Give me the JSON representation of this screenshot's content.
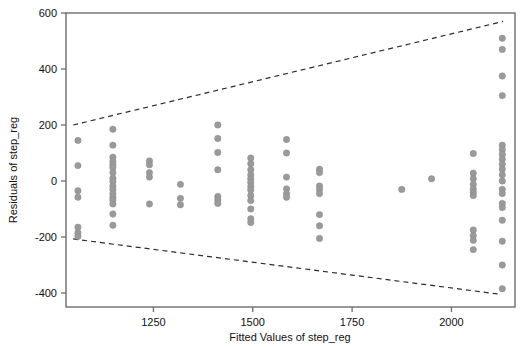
{
  "chart_data": {
    "type": "scatter",
    "title": "",
    "subtitle": "",
    "xlabel": "Fitted Values of step_reg",
    "ylabel": "Residuals of step_reg",
    "xlim": [
      1030,
      2160
    ],
    "ylim": [
      -450,
      600
    ],
    "xticks": [
      1250,
      1500,
      1750,
      2000
    ],
    "xtick_labels": [
      "1250",
      "1500",
      "1750",
      "2000"
    ],
    "yticks": [
      -400,
      -200,
      0,
      200,
      400,
      600
    ],
    "ytick_labels": [
      "-400",
      "-200",
      "0",
      "200",
      "400",
      "600"
    ],
    "grid": false,
    "legend": null,
    "legend_position": "none",
    "marker_color": "#9a9a9a",
    "marker_size": 3.2,
    "axis_color": "#6d6d6d",
    "text_color": "#111111",
    "annotations": [
      {
        "name": "upper-funnel-band",
        "type": "dashed-line",
        "x": [
          1048,
          2130
        ],
        "y": [
          200,
          570
        ],
        "color": "#2b2b2b",
        "dash": "5,4"
      },
      {
        "name": "lower-funnel-band",
        "type": "dashed-line",
        "x": [
          1048,
          2125
        ],
        "y": [
          -207,
          -405
        ],
        "color": "#2b2b2b",
        "dash": "5,4"
      }
    ],
    "series": [
      {
        "name": "residuals",
        "points": [
          [
            1060,
            145
          ],
          [
            1060,
            55
          ],
          [
            1060,
            -35
          ],
          [
            1060,
            -58
          ],
          [
            1060,
            -165
          ],
          [
            1060,
            -185
          ],
          [
            1060,
            -198
          ],
          [
            1148,
            185
          ],
          [
            1148,
            128
          ],
          [
            1148,
            85
          ],
          [
            1148,
            70
          ],
          [
            1148,
            58
          ],
          [
            1148,
            48
          ],
          [
            1148,
            30
          ],
          [
            1148,
            10
          ],
          [
            1148,
            -2
          ],
          [
            1148,
            -18
          ],
          [
            1148,
            -30
          ],
          [
            1148,
            -45
          ],
          [
            1148,
            -58
          ],
          [
            1148,
            -68
          ],
          [
            1148,
            -82
          ],
          [
            1148,
            -118
          ],
          [
            1148,
            -158
          ],
          [
            1240,
            72
          ],
          [
            1240,
            58
          ],
          [
            1240,
            30
          ],
          [
            1240,
            14
          ],
          [
            1240,
            -82
          ],
          [
            1318,
            -12
          ],
          [
            1318,
            -62
          ],
          [
            1318,
            -85
          ],
          [
            1412,
            200
          ],
          [
            1412,
            152
          ],
          [
            1412,
            102
          ],
          [
            1412,
            40
          ],
          [
            1412,
            -55
          ],
          [
            1412,
            -68
          ],
          [
            1412,
            -80
          ],
          [
            1495,
            82
          ],
          [
            1495,
            62
          ],
          [
            1495,
            40
          ],
          [
            1495,
            22
          ],
          [
            1495,
            8
          ],
          [
            1495,
            -5
          ],
          [
            1495,
            -20
          ],
          [
            1495,
            -32
          ],
          [
            1495,
            -52
          ],
          [
            1495,
            -70
          ],
          [
            1495,
            -100
          ],
          [
            1495,
            -135
          ],
          [
            1495,
            -148
          ],
          [
            1585,
            148
          ],
          [
            1585,
            100
          ],
          [
            1585,
            14
          ],
          [
            1585,
            -28
          ],
          [
            1585,
            -45
          ],
          [
            1585,
            -58
          ],
          [
            1668,
            42
          ],
          [
            1668,
            30
          ],
          [
            1668,
            -18
          ],
          [
            1668,
            -30
          ],
          [
            1668,
            -45
          ],
          [
            1668,
            -120
          ],
          [
            1668,
            -160
          ],
          [
            1668,
            -205
          ],
          [
            1875,
            -30
          ],
          [
            1950,
            8
          ],
          [
            2055,
            98
          ],
          [
            2055,
            28
          ],
          [
            2055,
            8
          ],
          [
            2055,
            -12
          ],
          [
            2055,
            -28
          ],
          [
            2055,
            -40
          ],
          [
            2055,
            -52
          ],
          [
            2055,
            -175
          ],
          [
            2055,
            -195
          ],
          [
            2055,
            -212
          ],
          [
            2055,
            -245
          ],
          [
            2128,
            510
          ],
          [
            2128,
            470
          ],
          [
            2128,
            375
          ],
          [
            2128,
            305
          ],
          [
            2128,
            128
          ],
          [
            2128,
            112
          ],
          [
            2128,
            95
          ],
          [
            2128,
            78
          ],
          [
            2128,
            60
          ],
          [
            2128,
            42
          ],
          [
            2128,
            22
          ],
          [
            2128,
            0
          ],
          [
            2128,
            -30
          ],
          [
            2128,
            -45
          ],
          [
            2128,
            -80
          ],
          [
            2128,
            -95
          ],
          [
            2128,
            -140
          ],
          [
            2128,
            -215
          ],
          [
            2128,
            -300
          ],
          [
            2128,
            -385
          ]
        ]
      }
    ]
  }
}
